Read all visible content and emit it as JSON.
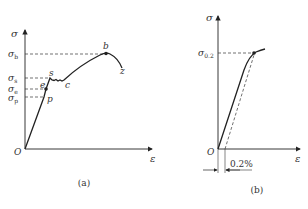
{
  "figure_a": {
    "caption": "(a)",
    "y_axis_label": "σ",
    "x_axis_label": "ε",
    "origin_label": "O",
    "y_ticks": [
      {
        "sym": "σ",
        "sub": "b"
      },
      {
        "sym": "σ",
        "sub": "s"
      },
      {
        "sym": "σ",
        "sub": "e"
      },
      {
        "sym": "σ",
        "sub": "p"
      }
    ],
    "points": {
      "p": "p",
      "e": "e",
      "s": "s",
      "c": "c",
      "b": "b",
      "z": "z"
    }
  },
  "figure_b": {
    "caption": "(b)",
    "y_axis_label": "σ",
    "x_axis_label": "ε",
    "origin_label": "O",
    "y_tick": {
      "sym": "σ",
      "sub": "0.2"
    },
    "offset_label": "0.2%"
  },
  "colors": {
    "line": "#222222",
    "text": "#333333",
    "background": "#ffffff"
  }
}
